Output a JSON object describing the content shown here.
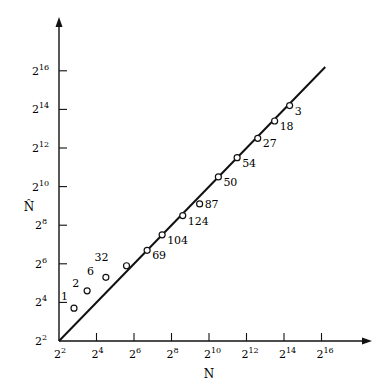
{
  "chart_data": {
    "type": "scatter",
    "title": "",
    "xlabel": "N",
    "ylabel": "N̂",
    "x_scale": "log2",
    "y_scale": "log2",
    "xlim_log2": [
      2,
      17.5
    ],
    "ylim_log2": [
      2,
      17.8
    ],
    "x_ticks": [
      "2^2",
      "2^4",
      "2^6",
      "2^8",
      "2^10",
      "2^12",
      "2^14",
      "2^16"
    ],
    "y_ticks": [
      "2^2",
      "2^4",
      "2^6",
      "2^8",
      "2^10",
      "2^12",
      "2^14",
      "2^16"
    ],
    "grid": false,
    "legend": null,
    "reference_line": {
      "description": "N̂ = N",
      "from_log2": [
        2,
        2
      ],
      "to_log2": [
        16.2,
        16.2
      ]
    },
    "points": [
      {
        "label": "1",
        "x_log2": 2.8,
        "y_log2": 3.7
      },
      {
        "label": "2",
        "x_log2": 3.5,
        "y_log2": 4.6
      },
      {
        "label": "6",
        "x_log2": 4.5,
        "y_log2": 5.3
      },
      {
        "label": "32",
        "x_log2": 5.6,
        "y_log2": 5.9
      },
      {
        "label": "69",
        "x_log2": 6.7,
        "y_log2": 6.7
      },
      {
        "label": "104",
        "x_log2": 7.5,
        "y_log2": 7.5
      },
      {
        "label": "124",
        "x_log2": 8.6,
        "y_log2": 8.5
      },
      {
        "label": "87",
        "x_log2": 9.5,
        "y_log2": 9.1
      },
      {
        "label": "50",
        "x_log2": 10.5,
        "y_log2": 10.5
      },
      {
        "label": "54",
        "x_log2": 11.5,
        "y_log2": 11.5
      },
      {
        "label": "27",
        "x_log2": 12.6,
        "y_log2": 12.5
      },
      {
        "label": "18",
        "x_log2": 13.5,
        "y_log2": 13.4
      },
      {
        "label": "3",
        "x_log2": 14.3,
        "y_log2": 14.2
      }
    ]
  },
  "axes": {
    "x_title": "N",
    "y_title": "N̂",
    "tick_base": "2",
    "tick_exponents": [
      "2",
      "4",
      "6",
      "8",
      "10",
      "12",
      "14",
      "16"
    ]
  }
}
